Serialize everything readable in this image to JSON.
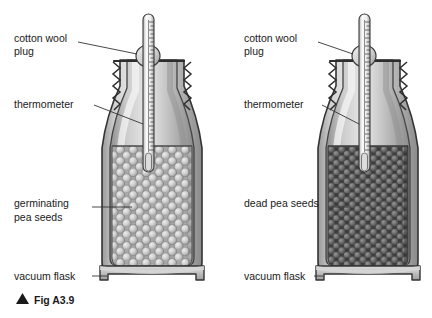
{
  "figure": {
    "caption": "Fig A3.9",
    "caption_marker": "triangle-up-icon",
    "background": "#ffffff",
    "ink": "#1a1a1a"
  },
  "colors": {
    "glass_light": "#e8e8e8",
    "glass_mid": "#b9b9b9",
    "glass_dark": "#7d7d7d",
    "outline": "#3a3a3a",
    "seed_live": "#c9c9c9",
    "seed_live_dark": "#8f8f8f",
    "seed_dead": "#6e6e6e",
    "seed_dead_dark": "#4a4a4a",
    "thermometer_fill": "#f2f2f2",
    "leader_line": "#333333"
  },
  "apparatus": [
    {
      "id": "left-flask",
      "labels": [
        {
          "name": "cotton-wool-plug",
          "lines": [
            "cotton wool",
            "plug"
          ]
        },
        {
          "name": "thermometer",
          "lines": [
            "thermometer"
          ]
        },
        {
          "name": "contents",
          "lines": [
            "germinating",
            "pea seeds"
          ]
        },
        {
          "name": "vacuum-flask",
          "lines": [
            "vacuum flask"
          ]
        }
      ],
      "contents_kind": "germinating",
      "seed_shade": "light"
    },
    {
      "id": "right-flask",
      "labels": [
        {
          "name": "cotton-wool-plug",
          "lines": [
            "cotton wool",
            "plug"
          ]
        },
        {
          "name": "thermometer",
          "lines": [
            "thermometer"
          ]
        },
        {
          "name": "contents",
          "lines": [
            "dead pea seeds"
          ]
        },
        {
          "name": "vacuum-flask",
          "lines": [
            "vacuum flask"
          ]
        }
      ],
      "contents_kind": "dead",
      "seed_shade": "dark"
    }
  ]
}
